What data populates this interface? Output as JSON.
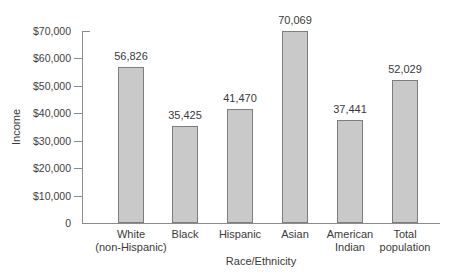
{
  "chart_data": {
    "type": "bar",
    "title": "",
    "xlabel": "Race/Ethnicity",
    "ylabel": "Income",
    "categories": [
      [
        "White",
        "(non-Hispanic)"
      ],
      [
        "Black"
      ],
      [
        "Hispanic"
      ],
      [
        "Asian"
      ],
      [
        "American",
        "Indian"
      ],
      [
        "Total",
        "population"
      ]
    ],
    "values": [
      56826,
      35425,
      41470,
      70069,
      37441,
      52029
    ],
    "value_labels": [
      "56,826",
      "35,425",
      "41,470",
      "70,069",
      "37,441",
      "52,029"
    ],
    "ylim": [
      0,
      70000
    ],
    "yticks": {
      "values": [
        0,
        10000,
        20000,
        30000,
        40000,
        50000,
        60000,
        70000
      ],
      "labels": [
        "0",
        "$10,000",
        "$20,000",
        "$30,000",
        "$40,000",
        "$50,000",
        "$60,000",
        "$70,000"
      ]
    },
    "grid": false,
    "legend": null,
    "colors": {
      "bar_fill": "#c9c9c9",
      "bar_border": "#7d7d7d",
      "axis": "#8c8c8c",
      "text": "#3a3a3a"
    }
  }
}
